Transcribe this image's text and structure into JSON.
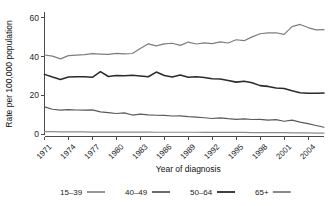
{
  "chart_data": {
    "type": "line",
    "title": "",
    "xlabel": "Year of diagnosis",
    "ylabel": "Rate per 100,000 population",
    "xlim": [
      1971,
      2006
    ],
    "ylim": [
      0,
      62
    ],
    "yticks": [
      0,
      20,
      40,
      60
    ],
    "xticks": [
      1971,
      1974,
      1977,
      1980,
      1983,
      1986,
      1989,
      1992,
      1995,
      1998,
      2001,
      2004
    ],
    "xtick_labels": [
      "1971",
      "1974",
      "1977",
      "1980",
      "1983",
      "1986",
      "1989",
      "1992",
      "1995",
      "1998",
      "2001",
      "2004"
    ],
    "ytick_labels": [
      "0",
      "20",
      "40",
      "60"
    ],
    "grid": false,
    "legend_position": "bottom",
    "x": [
      1971,
      1972,
      1973,
      1974,
      1975,
      1976,
      1977,
      1978,
      1979,
      1980,
      1981,
      1982,
      1983,
      1984,
      1985,
      1986,
      1987,
      1988,
      1989,
      1990,
      1991,
      1992,
      1993,
      1994,
      1995,
      1996,
      1997,
      1998,
      1999,
      2000,
      2001,
      2002,
      2003,
      2004,
      2005,
      2006
    ],
    "series": [
      {
        "name": "15-39",
        "label": "15–39",
        "color": "#8c8c8c",
        "values": [
          1.2,
          1.2,
          1.1,
          1.1,
          1.1,
          1.1,
          1.0,
          1.0,
          1.0,
          1.0,
          1.0,
          1.0,
          1.0,
          1.0,
          0.9,
          0.9,
          0.9,
          0.9,
          0.9,
          0.9,
          0.8,
          0.8,
          0.8,
          0.8,
          0.8,
          0.8,
          0.7,
          0.7,
          0.7,
          0.7,
          0.7,
          0.6,
          0.6,
          0.6,
          0.5,
          0.5
        ]
      },
      {
        "name": "40-49",
        "label": "40–49",
        "color": "#5a5a5a",
        "values": [
          14.0,
          12.8,
          12.3,
          12.6,
          12.4,
          12.3,
          12.5,
          11.4,
          11.0,
          10.6,
          10.9,
          9.8,
          10.3,
          9.9,
          9.7,
          9.6,
          9.3,
          9.4,
          9.0,
          8.7,
          8.4,
          8.0,
          8.3,
          7.9,
          7.6,
          7.8,
          7.5,
          7.6,
          7.2,
          7.4,
          6.6,
          7.2,
          6.1,
          5.4,
          4.4,
          3.5
        ]
      },
      {
        "name": "50-64",
        "label": "50–64",
        "color": "#2b2b2b",
        "values": [
          30.8,
          29.4,
          28.2,
          29.5,
          29.6,
          29.6,
          29.3,
          32.2,
          29.7,
          30.2,
          30.1,
          30.3,
          30.0,
          29.6,
          32.0,
          30.2,
          29.4,
          30.5,
          29.3,
          29.6,
          29.2,
          28.5,
          28.4,
          27.7,
          26.8,
          27.3,
          26.5,
          25.0,
          24.6,
          23.8,
          23.5,
          22.3,
          21.3,
          21.0,
          21.1,
          21.2
        ]
      },
      {
        "name": "65+",
        "label": "65+",
        "color": "#7d7d7d",
        "values": [
          40.8,
          40.2,
          38.8,
          40.5,
          40.8,
          41.0,
          41.5,
          41.3,
          41.1,
          41.7,
          41.4,
          41.6,
          44.2,
          46.6,
          45.5,
          46.6,
          46.9,
          45.8,
          47.5,
          46.5,
          47.1,
          46.7,
          47.6,
          47.0,
          48.7,
          48.2,
          50.2,
          51.8,
          52.2,
          52.3,
          51.5,
          55.5,
          56.6,
          55.0,
          53.8,
          53.9
        ]
      }
    ]
  },
  "legend": {
    "items": [
      {
        "label": "15–39"
      },
      {
        "label": "40–49"
      },
      {
        "label": "50–64"
      },
      {
        "label": "65+"
      }
    ]
  },
  "colors": {
    "axis": "#4a4a4a",
    "text": "#1a1a1a",
    "background": "#ffffff"
  }
}
